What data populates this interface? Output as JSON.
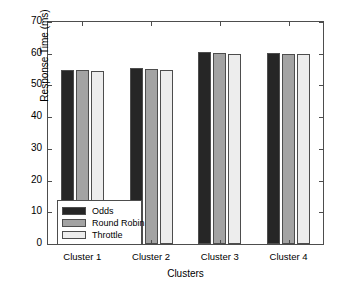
{
  "chart_data": {
    "type": "bar",
    "title": "",
    "xlabel": "Clusters",
    "ylabel": "Response Time (ms)",
    "categories": [
      "Cluster 1",
      "Cluster 2",
      "Cluster 3",
      "Cluster 4"
    ],
    "series": [
      {
        "name": "Odds",
        "color": "#262626",
        "values": [
          55,
          55.4,
          60.5,
          60.2
        ]
      },
      {
        "name": "Round Robin",
        "color": "#a3a3a3",
        "values": [
          54.9,
          55.3,
          60.3,
          60.0
        ]
      },
      {
        "name": "Throttle",
        "color": "#ededed",
        "values": [
          54.6,
          54.8,
          60.0,
          59.8
        ]
      }
    ],
    "ylim": [
      0,
      70
    ],
    "yticks": [
      0,
      10,
      20,
      30,
      40,
      50,
      60,
      70
    ],
    "ytick_labels": [
      "0",
      "10",
      "20",
      "30",
      "40",
      "50",
      "60",
      "70"
    ],
    "grid": false,
    "legend_position": "lower left",
    "legend_entries": [
      "Odds",
      "Round Robin",
      "Throttle"
    ]
  }
}
